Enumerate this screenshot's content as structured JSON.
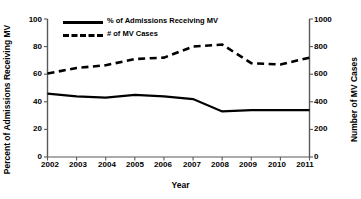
{
  "chart_data": {
    "type": "line",
    "title": "",
    "xlabel": "Year",
    "ylabel": "Percent of Admissions Receiving MV",
    "y2label": "Number of MV Cases",
    "categories": [
      "2002",
      "2003",
      "2004",
      "2005",
      "2006",
      "2007",
      "2008",
      "2009",
      "2010",
      "2011"
    ],
    "x": [
      2002,
      2003,
      2004,
      2005,
      2006,
      2007,
      2008,
      2009,
      2010,
      2011
    ],
    "ylim": [
      0,
      100
    ],
    "y2lim": [
      0,
      1000
    ],
    "yticks": [
      0,
      20,
      40,
      60,
      80,
      100
    ],
    "y2ticks": [
      0,
      200,
      400,
      600,
      800,
      1000
    ],
    "grid": false,
    "legend_position": "top-left",
    "series": [
      {
        "name": "% of Admissions Receiving MV",
        "axis": "left",
        "style": "solid",
        "color": "#000000",
        "values": [
          46,
          44,
          43,
          45,
          44,
          42,
          33,
          34,
          34,
          34
        ]
      },
      {
        "name": "# of MV Cases",
        "axis": "right",
        "style": "dashed",
        "color": "#000000",
        "values": [
          605,
          645,
          665,
          710,
          720,
          800,
          815,
          680,
          670,
          720
        ]
      }
    ]
  },
  "legend": {
    "items": [
      {
        "label": "% of Admissions Receiving MV",
        "style": "solid"
      },
      {
        "label": "# of MV Cases",
        "style": "dashed"
      }
    ]
  },
  "axes": {
    "left": {
      "title": "Percent of Admissions Receiving MV",
      "ticks": [
        "100",
        "80",
        "60",
        "40",
        "20",
        "0"
      ]
    },
    "right": {
      "title": "Number of MV Cases",
      "ticks": [
        "1000",
        "800",
        "600",
        "400",
        "200",
        "0"
      ]
    },
    "bottom": {
      "title": "Year",
      "ticks": [
        "2002",
        "2003",
        "2004",
        "2005",
        "2006",
        "2007",
        "2008",
        "2009",
        "2010",
        "2011"
      ]
    }
  },
  "colors": {
    "line": "#000000",
    "axis": "#595959",
    "background": "#ffffff"
  }
}
